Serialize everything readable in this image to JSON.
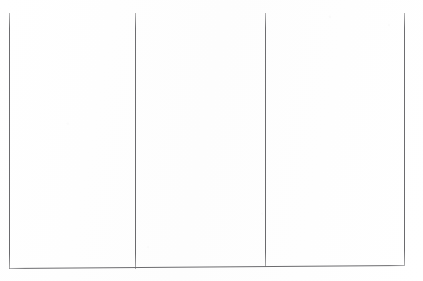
{
  "document": {
    "kind": "scanned-blank-form",
    "page_background": "#fefefe",
    "rule_color": "#6a6a6d",
    "width": 423,
    "height": 281,
    "visible_text": "",
    "note": ""
  },
  "table": {
    "columns": [
      {
        "name": "column-1",
        "content": ""
      },
      {
        "name": "column-2",
        "content": ""
      },
      {
        "name": "column-3",
        "content": ""
      }
    ],
    "vertical_rules": [
      {
        "name": "rule-left-border",
        "x": 9,
        "y_top": 13,
        "y_bottom": 268
      },
      {
        "name": "rule-divider-one",
        "x": 135,
        "y_top": 13,
        "y_bottom": 268
      },
      {
        "name": "rule-divider-two",
        "x": 265,
        "y_top": 13,
        "y_bottom": 266
      },
      {
        "name": "rule-right-border",
        "x": 404,
        "y_top": 13,
        "y_bottom": 265
      }
    ],
    "horizontal_rules": [
      {
        "name": "rule-bottom-border",
        "x_start": 9,
        "x_end": 404,
        "y": 268,
        "slant_deg": -0.45
      }
    ],
    "top_border_present": false
  }
}
